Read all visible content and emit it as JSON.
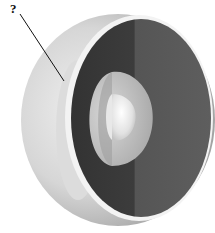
{
  "diagram": {
    "label": "?",
    "label_points_to": "outer shell layer beneath crust (mantle region on exterior half)",
    "colors": {
      "background": "#ffffff",
      "outer_shell_light": "#e6e6e6",
      "outer_shell_shadow": "#9a9a9a",
      "rim": "#f2f2f2",
      "mantle_face_left": "#3a3a3a",
      "mantle_face_right": "#5a5a5a",
      "outer_core": "#bdbdbd",
      "inner_core": "#f4f4f4",
      "leader_line": "#111111"
    }
  }
}
